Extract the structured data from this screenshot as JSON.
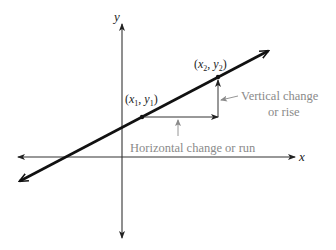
{
  "diagram": {
    "type": "slope-of-line",
    "axes": {
      "x_label": "x",
      "y_label": "y"
    },
    "points": [
      {
        "id": "p1",
        "label_x": "x",
        "label_x_sub": "1",
        "label_y": "y",
        "label_y_sub": "1"
      },
      {
        "id": "p2",
        "label_x": "x",
        "label_x_sub": "2",
        "label_y": "y",
        "label_y_sub": "2"
      }
    ],
    "annotations": {
      "vertical_line1": "Vertical change",
      "vertical_line2": "or rise",
      "horizontal": "Horizontal change or run"
    },
    "colors": {
      "line": "#111111",
      "axes": "#333333",
      "annotation": "#8a8a8a"
    }
  }
}
